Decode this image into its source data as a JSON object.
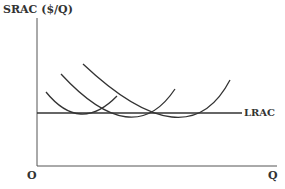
{
  "diagram": {
    "y_axis_label": "SRAC ($/Q)",
    "x_axis_label": "Q",
    "origin_label": "O",
    "lrac_label": "LRAC",
    "curves": [
      {
        "name": "SRAC1",
        "start": [
          46,
          92
        ],
        "min": [
          80,
          113
        ],
        "end": [
          117,
          96
        ]
      },
      {
        "name": "SRAC2",
        "start": [
          61,
          74
        ],
        "min": [
          133,
          113
        ],
        "end": [
          175,
          89
        ]
      },
      {
        "name": "SRAC3",
        "start": [
          83,
          64
        ],
        "min": [
          187,
          113
        ],
        "end": [
          230,
          80
        ]
      }
    ],
    "lrac_line": {
      "x1": 37,
      "x2": 242,
      "y": 113
    },
    "colors": {
      "line": "#333333",
      "background": "#ffffff"
    }
  }
}
